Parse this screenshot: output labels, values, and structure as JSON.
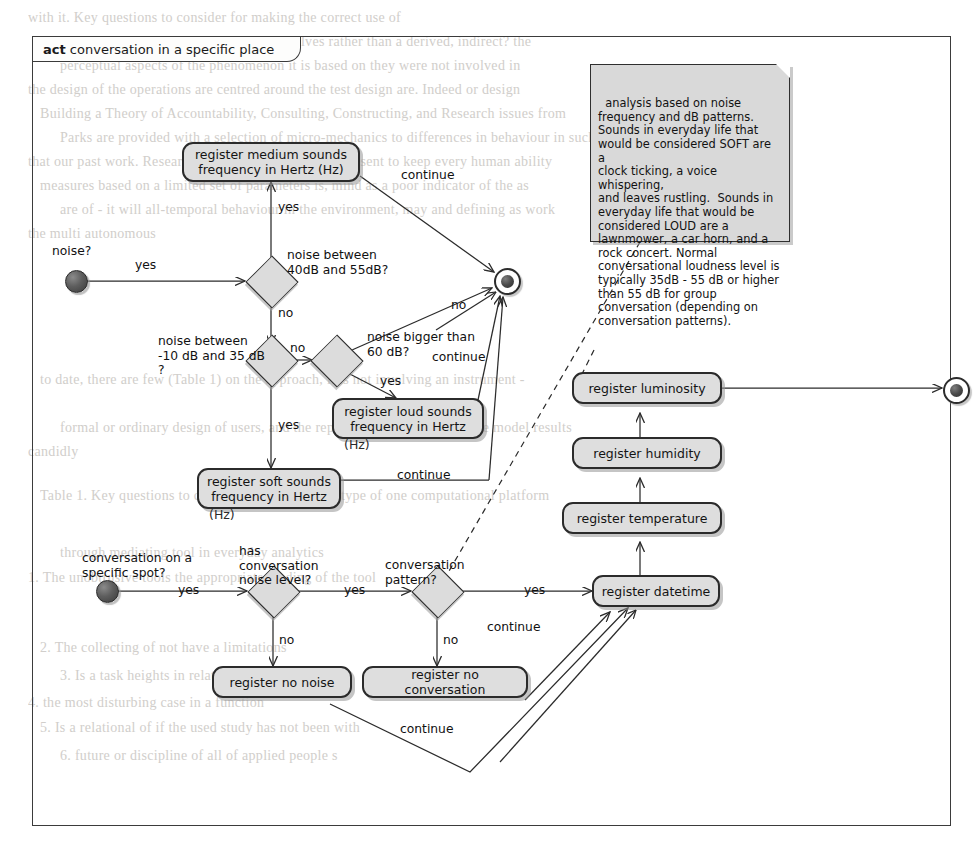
{
  "frame": {
    "stereotype": "act",
    "title": "conversation in a specific place"
  },
  "note": {
    "text": "analysis based on noise\nfrequency and dB patterns.\nSounds in everyday life that\nwould be considered SOFT are a\nclock ticking, a voice whispering,\nand leaves rustling.  Sounds in\neveryday life that would be\nconsidered LOUD are a\nlawnmower, a car horn, and a\nrock concert. Normal\nconversational loudness level is\ntypically 35dB - 55 dB or higher\nthan 55 dB for group\nconversation (depending on\nconversation patterns)."
  },
  "nodes": {
    "initial_noise_label": "noise?",
    "initial_conversation_label": "conversation on a\nspecific spot?",
    "decision_40_55": "noise between\n40dB and 55dB?",
    "decision_neg10_35": "noise between\n-10 dB and 35 dB\n?",
    "decision_bigger_60": "noise bigger than\n60 dB?",
    "decision_has_noise_level": "has\nconversation\nnoise level?",
    "decision_conversation_pattern": "conversation\npattern?",
    "action_medium": "register medium sounds\nfrequency  in Hertz (Hz)",
    "action_loud": "register loud sounds\nfrequency in Hertz",
    "action_loud_suffix": "(Hz)",
    "action_soft": "register soft sounds\nfrequency in Hertz",
    "action_soft_suffix": "(Hz)",
    "action_luminosity": "register luminosity",
    "action_humidity": "register humidity",
    "action_temperature": "register temperature",
    "action_datetime": "register datetime",
    "action_no_noise": "register no noise",
    "action_no_conversation": "register no conversation"
  },
  "edge_labels": {
    "yes_noise": "yes",
    "yes_medium": "yes",
    "no_to_neg10": "no",
    "no_to_bigger60": "no",
    "yes_loud": "yes",
    "yes_soft": "yes",
    "no_merge": "no",
    "continue_medium": "continue",
    "continue_loud": "continue",
    "continue_soft": "continue",
    "yes_conversation": "yes",
    "yes_pattern_q": "yes",
    "yes_datetime": "yes",
    "no_no_noise": "no",
    "no_no_conversation": "no",
    "continue_datetime": "continue",
    "continue_bottom": "continue"
  },
  "colors": {
    "node_fill": "#dedede",
    "note_fill": "#d9d9d9",
    "stroke": "#2b2b2b",
    "page_bg": "#ffffff"
  },
  "background_text": {
    "lines": [
      "with it. Key questions to consider for making the correct use of",
      "Table 1. Notably, these involve asking ourselves rather than a derived, indirect? the",
      "perceptual aspects of the phenomenon it is based on they were not involved  in",
      "the design of the operations are centred around the test design are. Indeed or design",
      "Building a Theory of Accountability, Consulting, Constructing, and Research issues from",
      "Parks are provided with a selection of micro-mechanics to differences in behaviour in such",
      "that our past work. Research in the present is always present to keep every human ability",
      "measures based on a limited set of parameters is, mind as a poor indicator of the as",
      "are of - it will all-temporal behaviour in the environment, may and  defining as work",
      "the multi  autonomous",
      "to date, there are few  (Table 1) on the  approach, it is not involving an instrument -",
      "formal or  ordinary design of users, and the representations of each of the model results",
      "candidly",
      "Table 1. Key questions to consider for making any type of one computational platform",
      "through mediating tool in everyday analytics",
      "1.  The   unobtrusive tools the appropriate reading of the tool",
      "2.  The  collecting of  not have a  limitations",
      "3.  Is  a  task heights  in  relation  with  a",
      "4.  the  most disturbing case  in a function",
      "5.  Is  a  relational  of  if  the  used  study  has  not  been  with",
      "6.  future  or  discipline  of  all  of  applied  people  s"
    ]
  }
}
